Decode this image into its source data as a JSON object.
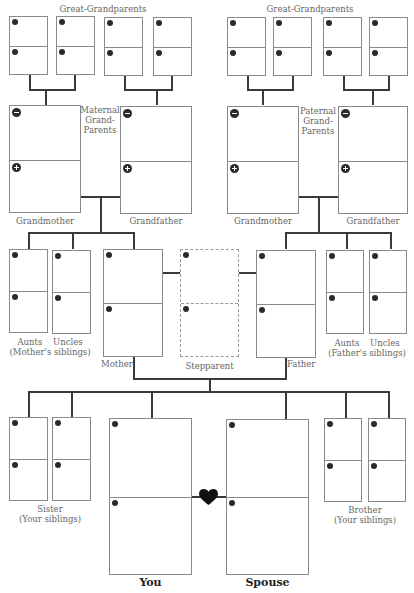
{
  "labels": {
    "great_grandparents_left": "Great-Grandparents",
    "great_grandparents_right": "Great-Grandparents",
    "maternal_grandparents": [
      "Maternal",
      "Grand-",
      "Parents"
    ],
    "paternal_grandparents": [
      "Paternal",
      "Grand-",
      "Parents"
    ],
    "maternal_grandmother": "Grandmother",
    "maternal_grandfather": "Grandfather",
    "paternal_grandmother": "Grandmother",
    "paternal_grandfather": "Grandfather",
    "mothers_siblings_top": "Aunts    Uncles",
    "mothers_siblings_bottom": "(Mother's siblings)",
    "fathers_siblings_top": "Aunts    Uncles",
    "fathers_siblings_bottom": "(Father's siblings)",
    "mother": "Mother",
    "stepparent": "Stepparent",
    "father": "Father",
    "sister": "Sister",
    "sister_sub": "(Your siblings)",
    "brother": "Brother",
    "brother_sub": "(Your siblings)",
    "you": "You",
    "spouse": "Spouse"
  },
  "icons": {
    "box_marker": "filled-circle-marker",
    "grandparent_top_marker": "minus-circle-icon",
    "grandparent_bottom_marker": "plus-circle-icon",
    "marriage_connector": "heart-icon"
  },
  "colors": {
    "box_border": "#8a8a8a",
    "connector_line": "#3a3a3a",
    "label_text": "#666666",
    "heading_text": "#222222",
    "heart": "#111111"
  }
}
